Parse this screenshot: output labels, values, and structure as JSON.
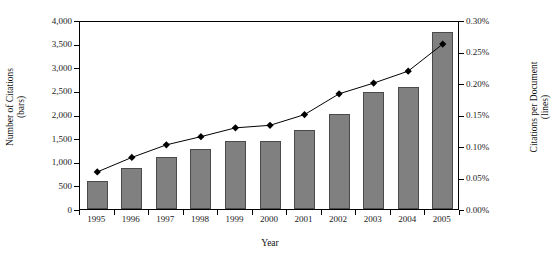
{
  "chart_data": {
    "type": "bar",
    "title": "",
    "xlabel": "Year",
    "categories": [
      "1995",
      "1996",
      "1997",
      "1998",
      "1999",
      "2000",
      "2001",
      "2002",
      "2003",
      "2004",
      "2005"
    ],
    "grid": false,
    "legend": "none",
    "series": [
      {
        "name": "Number of Citations (bars)",
        "type": "bar",
        "axis": "left",
        "color": "#808080",
        "values": [
          600,
          860,
          1100,
          1260,
          1430,
          1450,
          1680,
          2010,
          2470,
          2590,
          3750
        ]
      },
      {
        "name": "Citations per Document (lines)",
        "type": "line",
        "axis": "right",
        "color": "#000000",
        "marker": "diamond",
        "values": [
          0.062,
          0.085,
          0.105,
          0.118,
          0.132,
          0.136,
          0.153,
          0.186,
          0.203,
          0.222,
          0.265
        ]
      }
    ],
    "left_axis": {
      "label": "Number of Citations (bars)",
      "label_line1": "Number of Citations",
      "label_line2": "(bars)",
      "ylim": [
        0,
        4000
      ],
      "ticks": [
        0,
        500,
        1000,
        1500,
        2000,
        2500,
        3000,
        3500,
        4000
      ],
      "ticklabels": [
        "0",
        "500",
        "1,000",
        "1,500",
        "2,000",
        "2,500",
        "3,000",
        "3,500",
        "4,000"
      ]
    },
    "right_axis": {
      "label": "Citations per Document (lines)",
      "label_line1": "Citations per Document",
      "label_line2": "(lines)",
      "ylim": [
        0,
        0.3
      ],
      "ticks": [
        0,
        0.05,
        0.1,
        0.15,
        0.2,
        0.25,
        0.3
      ],
      "ticklabels": [
        "0.00%",
        "0.05%",
        "0.10%",
        "0.15%",
        "0.20%",
        "0.25%",
        "0.30%"
      ]
    }
  }
}
